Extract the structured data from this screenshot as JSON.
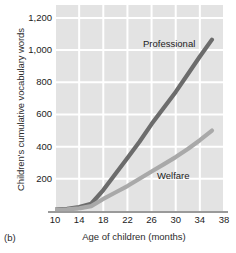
{
  "figure": {
    "panel_caption": "(b)"
  },
  "chart_data": {
    "type": "line",
    "title": "",
    "xlabel": "Age of children (months)",
    "ylabel": "Children's cumulative vocabulary words",
    "xlim": [
      10,
      38
    ],
    "ylim": [
      0,
      1280
    ],
    "xticks": [
      10,
      14,
      18,
      22,
      26,
      30,
      34,
      38
    ],
    "xtick_labels": [
      "10",
      "14",
      "18",
      "22",
      "26",
      "30",
      "34",
      "38"
    ],
    "yticks": [
      200,
      400,
      600,
      800,
      1000,
      1200
    ],
    "ytick_labels": [
      "200",
      "400",
      "600",
      "800",
      "1,000",
      "1,200"
    ],
    "grid": true,
    "grid_color": "#ffffff",
    "plot_background": "#e3e3e3",
    "legend_position": "inline-annotations",
    "series": [
      {
        "name": "Professional",
        "color": "#6c6c6c",
        "label_position": {
          "x": 26,
          "y": 1090
        },
        "x": [
          10,
          12,
          14,
          16,
          18,
          20,
          22,
          24,
          26,
          28,
          30,
          32,
          34,
          36
        ],
        "values": [
          8,
          14,
          24,
          45,
          130,
          230,
          330,
          430,
          540,
          640,
          740,
          850,
          960,
          1065
        ]
      },
      {
        "name": "Welfare",
        "color": "#a9a9a9",
        "label_position": {
          "x": 29,
          "y": 250
        },
        "x": [
          10,
          12,
          14,
          16,
          18,
          20,
          22,
          24,
          26,
          28,
          30,
          32,
          34,
          36
        ],
        "values": [
          6,
          10,
          16,
          30,
          75,
          115,
          155,
          200,
          245,
          290,
          335,
          385,
          440,
          500
        ]
      }
    ]
  }
}
